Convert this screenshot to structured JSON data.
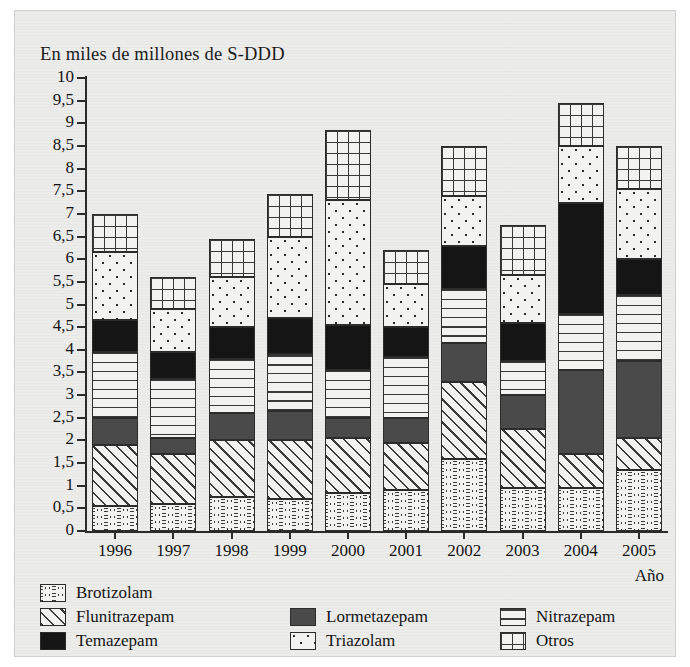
{
  "chart_data": {
    "type": "bar",
    "title": "En miles de millones de S-DDD",
    "xlabel": "Año",
    "ylabel": "",
    "ylim": [
      0,
      10
    ],
    "ytick_step": 0.5,
    "grid": false,
    "stacked": true,
    "legend_position": "bottom",
    "categories": [
      "1996",
      "1997",
      "1998",
      "1999",
      "2000",
      "2001",
      "2002",
      "2003",
      "2004",
      "2005"
    ],
    "ytick_labels": [
      "0",
      "0,5",
      "1",
      "1,5",
      "2",
      "2,5",
      "3",
      "3,5",
      "4",
      "4,5",
      "5",
      "5,5",
      "6",
      "6,5",
      "7",
      "7,5",
      "8",
      "8,5",
      "9",
      "9,5",
      "10"
    ],
    "series": [
      {
        "name": "Brotizolam",
        "pattern": "wavy-lines",
        "values": [
          0.55,
          0.6,
          0.75,
          0.7,
          0.85,
          0.9,
          1.6,
          0.95,
          0.95,
          1.35
        ]
      },
      {
        "name": "Flunitrazepam",
        "pattern": "diagonal-hatch",
        "values": [
          1.35,
          1.1,
          1.25,
          1.3,
          1.2,
          1.05,
          1.7,
          1.3,
          0.75,
          0.7
        ]
      },
      {
        "name": "Lormetazepam",
        "pattern": "sparse-dashes",
        "values": [
          0.6,
          0.35,
          0.6,
          0.65,
          0.45,
          0.55,
          0.85,
          0.75,
          1.85,
          1.7
        ]
      },
      {
        "name": "Nitrazepam",
        "pattern": "horizontal-lines",
        "values": [
          1.45,
          1.3,
          1.2,
          1.25,
          1.05,
          1.35,
          1.2,
          0.75,
          1.25,
          1.45
        ]
      },
      {
        "name": "Temazepam",
        "pattern": "solid-black",
        "values": [
          0.7,
          0.6,
          0.7,
          0.8,
          1.0,
          0.65,
          0.95,
          0.85,
          2.45,
          0.8
        ]
      },
      {
        "name": "Triazolam",
        "pattern": "dense-dots",
        "values": [
          1.5,
          0.95,
          1.1,
          1.8,
          2.75,
          0.95,
          1.1,
          1.05,
          1.25,
          1.55
        ]
      },
      {
        "name": "Otros",
        "pattern": "grid",
        "values": [
          0.85,
          0.7,
          0.85,
          0.95,
          1.55,
          0.75,
          1.1,
          1.1,
          0.95,
          0.95
        ]
      }
    ],
    "totals": [
      7.0,
      5.6,
      6.45,
      7.45,
      8.85,
      6.2,
      8.5,
      6.75,
      9.45,
      8.5
    ]
  }
}
